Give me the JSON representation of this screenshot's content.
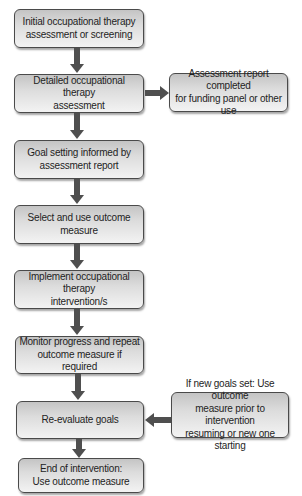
{
  "flowchart": {
    "main_steps": [
      {
        "line1": "Initial occupational therapy",
        "line2": "assessment or screening"
      },
      {
        "line1": "Detailed occupational therapy",
        "line2": "assessment"
      },
      {
        "line1": "Goal setting informed by",
        "line2": "assessment report"
      },
      {
        "line1": "Select and use outcome measure",
        "line2": ""
      },
      {
        "line1": "Implement occupational therapy",
        "line2": "intervention/s"
      },
      {
        "line1": "Monitor progress and repeat",
        "line2": "outcome measure if required"
      },
      {
        "line1": "Re-evaluate goals",
        "line2": ""
      },
      {
        "line1": "End of intervention:",
        "line2": "Use outcome measure"
      }
    ],
    "side_boxes": [
      {
        "line1": "Assessment report completed",
        "line2": "for funding panel or other use",
        "line3": ""
      },
      {
        "line1": "If new goals set: Use outcome",
        "line2": "measure prior to intervention",
        "line3": "resuming or new one starting"
      }
    ],
    "colors": {
      "border": "#4a4a4a",
      "arrow": "#4f4f4f",
      "box_gradient_top": "#c4c4c4",
      "box_gradient_bottom": "#f3f3f3",
      "text": "#1e1e1e"
    }
  }
}
